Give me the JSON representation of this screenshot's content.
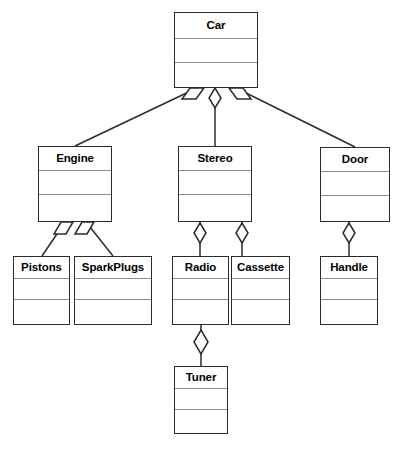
{
  "diagram": {
    "type": "uml-class-diagram",
    "notation": "aggregation",
    "canvas": {
      "width": 403,
      "height": 455
    },
    "colors": {
      "background": "#ffffff",
      "box_border": "#2b2b2b",
      "box_fill": "#ffffff",
      "divider": "#8d8d8d",
      "edge": "#2b2b2b",
      "diamond_fill": "#ffffff",
      "caption": "#c9c9c9"
    },
    "classes": [
      {
        "id": "car",
        "name": "Car",
        "x": 174,
        "y": 12,
        "w": 84,
        "h": 76,
        "name_h": 26,
        "attr_h": 24
      },
      {
        "id": "engine",
        "name": "Engine",
        "x": 38,
        "y": 146,
        "w": 74,
        "h": 76,
        "name_h": 24,
        "attr_h": 24
      },
      {
        "id": "stereo",
        "name": "Stereo",
        "x": 178,
        "y": 146,
        "w": 74,
        "h": 76,
        "name_h": 24,
        "attr_h": 24
      },
      {
        "id": "door",
        "name": "Door",
        "x": 320,
        "y": 147,
        "w": 70,
        "h": 75,
        "name_h": 24,
        "attr_h": 24
      },
      {
        "id": "pistons",
        "name": "Pistons",
        "x": 13,
        "y": 256,
        "w": 57,
        "h": 69,
        "name_h": 22,
        "attr_h": 21
      },
      {
        "id": "sparkplugs",
        "name": "SparkPlugs",
        "x": 74,
        "y": 256,
        "w": 78,
        "h": 69,
        "name_h": 22,
        "attr_h": 21
      },
      {
        "id": "radio",
        "name": "Radio",
        "x": 172,
        "y": 256,
        "w": 57,
        "h": 69,
        "name_h": 22,
        "attr_h": 21
      },
      {
        "id": "cassette",
        "name": "Cassette",
        "x": 231,
        "y": 256,
        "w": 59,
        "h": 69,
        "name_h": 22,
        "attr_h": 21
      },
      {
        "id": "handle",
        "name": "Handle",
        "x": 320,
        "y": 256,
        "w": 58,
        "h": 69,
        "name_h": 22,
        "attr_h": 21
      },
      {
        "id": "tuner",
        "name": "Tuner",
        "x": 174,
        "y": 366,
        "w": 54,
        "h": 68,
        "name_h": 22,
        "attr_h": 21
      }
    ],
    "relationships": [
      {
        "whole": "car",
        "part": "engine",
        "kind": "aggregation",
        "diamond_at": "whole"
      },
      {
        "whole": "car",
        "part": "stereo",
        "kind": "aggregation",
        "diamond_at": "whole"
      },
      {
        "whole": "car",
        "part": "door",
        "kind": "aggregation",
        "diamond_at": "whole"
      },
      {
        "whole": "engine",
        "part": "pistons",
        "kind": "aggregation",
        "diamond_at": "whole"
      },
      {
        "whole": "engine",
        "part": "sparkplugs",
        "kind": "aggregation",
        "diamond_at": "whole"
      },
      {
        "whole": "stereo",
        "part": "radio",
        "kind": "aggregation",
        "diamond_at": "whole"
      },
      {
        "whole": "stereo",
        "part": "cassette",
        "kind": "aggregation",
        "diamond_at": "whole"
      },
      {
        "whole": "door",
        "part": "handle",
        "kind": "aggregation",
        "diamond_at": "whole"
      },
      {
        "whole": "radio",
        "part": "tuner",
        "kind": "aggregation",
        "diamond_at": "whole"
      }
    ]
  },
  "caption": {
    "text": "",
    "clipped": true
  }
}
